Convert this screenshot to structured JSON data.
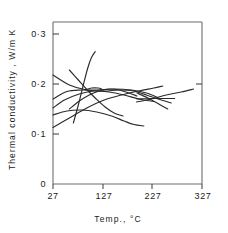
{
  "chart_data": {
    "type": "line",
    "title": "",
    "xlabel": "Temp., °C",
    "ylabel": "Thermal conductivity , W/m K",
    "xlim": [
      27,
      327
    ],
    "ylim": [
      0,
      0.33
    ],
    "xticks": [
      27,
      127,
      227,
      327
    ],
    "xtick_labels": [
      "27",
      "127",
      "227",
      "327"
    ],
    "yticks": [
      0,
      0.1,
      0.2,
      0.3
    ],
    "ytick_labels": [
      "0",
      "0·1",
      "0·2",
      "0·3"
    ],
    "grid": false,
    "legend": "none",
    "series": [
      {
        "name": "curve-1",
        "x": [
          27,
          60,
          95,
          130,
          160,
          190,
          215,
          245,
          265
        ],
        "y": [
          0.218,
          0.198,
          0.188,
          0.186,
          0.188,
          0.186,
          0.178,
          0.168,
          0.162
        ]
      },
      {
        "name": "curve-2",
        "x": [
          27,
          55,
          85,
          115,
          150,
          185,
          215,
          240
        ],
        "y": [
          0.17,
          0.185,
          0.188,
          0.188,
          0.19,
          0.188,
          0.182,
          0.172
        ]
      },
      {
        "name": "curve-3",
        "x": [
          27,
          50,
          80,
          110,
          140,
          170,
          200,
          230
        ],
        "y": [
          0.152,
          0.168,
          0.18,
          0.186,
          0.184,
          0.178,
          0.17,
          0.165
        ]
      },
      {
        "name": "curve-4",
        "x": [
          27,
          55,
          85,
          115,
          145,
          170,
          190,
          210
        ],
        "y": [
          0.138,
          0.146,
          0.148,
          0.144,
          0.136,
          0.126,
          0.119,
          0.116
        ]
      },
      {
        "name": "curve-5",
        "x": [
          27,
          60,
          95,
          130,
          165,
          200,
          230,
          248
        ],
        "y": [
          0.113,
          0.132,
          0.152,
          0.168,
          0.178,
          0.186,
          0.192,
          0.196
        ]
      },
      {
        "name": "curve-6",
        "x": [
          68,
          78,
          88,
          97,
          104,
          112
        ],
        "y": [
          0.122,
          0.158,
          0.198,
          0.232,
          0.252,
          0.265
        ]
      },
      {
        "name": "curve-7",
        "x": [
          60,
          78,
          96,
          114,
          132,
          150,
          168
        ],
        "y": [
          0.228,
          0.208,
          0.188,
          0.17,
          0.154,
          0.142,
          0.136
        ]
      },
      {
        "name": "curve-8",
        "x": [
          60,
          80,
          100,
          120,
          140,
          160,
          180,
          196
        ],
        "y": [
          0.15,
          0.166,
          0.178,
          0.186,
          0.19,
          0.188,
          0.182,
          0.176
        ]
      },
      {
        "name": "curve-9",
        "x": [
          195,
          225,
          255,
          285,
          310
        ],
        "y": [
          0.164,
          0.17,
          0.178,
          0.184,
          0.19
        ]
      },
      {
        "name": "curve-10",
        "x": [
          196,
          218,
          240,
          258
        ],
        "y": [
          0.182,
          0.172,
          0.16,
          0.15
        ]
      },
      {
        "name": "curve-11",
        "x": [
          196,
          225,
          255,
          272
        ],
        "y": [
          0.17,
          0.171,
          0.171,
          0.171
        ]
      },
      {
        "name": "curve-12",
        "x": [
          92,
          105,
          118,
          125
        ],
        "y": [
          0.188,
          0.192,
          0.192,
          0.19
        ]
      }
    ]
  },
  "axes": {
    "y_axis_title": "Thermal conductivity , W/m K",
    "x_axis_title": "Temp., °C"
  }
}
